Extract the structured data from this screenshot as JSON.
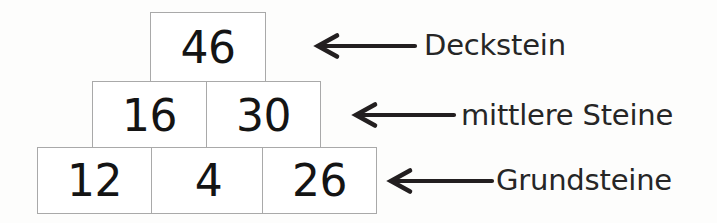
{
  "diagram": {
    "type": "number-pyramid",
    "language": "de",
    "background_color": "#fdfdfc",
    "cell_border_color": "#a9a9a9",
    "cell_fill_color": "#ffffff",
    "text_color": "#141414",
    "arrow_color": "#231f20",
    "label_color": "#262626",
    "rows": [
      {
        "row_name": "top",
        "cells": [
          {
            "value": "46"
          }
        ]
      },
      {
        "row_name": "middle",
        "cells": [
          {
            "value": "16"
          },
          {
            "value": "30"
          }
        ]
      },
      {
        "row_name": "base",
        "cells": [
          {
            "value": "12"
          },
          {
            "value": "4"
          },
          {
            "value": "26"
          }
        ]
      }
    ],
    "annotations": [
      {
        "arrow_name": "arrow-to-top-stone",
        "direction": "left",
        "label": "Deckstein"
      },
      {
        "arrow_name": "arrow-to-middle-stones",
        "direction": "left",
        "label": "mittlere Steine"
      },
      {
        "arrow_name": "arrow-to-base-stones",
        "direction": "left",
        "label": "Grundsteine"
      }
    ]
  }
}
